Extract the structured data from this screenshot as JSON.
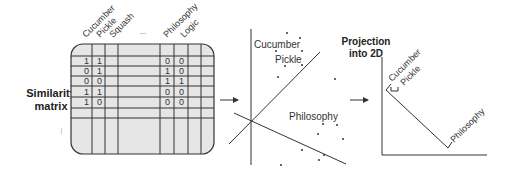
{
  "matrix_panel": {
    "label_line1": "Similarity",
    "label_line2": "matrix",
    "column_headers": [
      "Cucumber",
      "Pickle",
      "Squash",
      "...",
      "Philosophy",
      "Logic"
    ],
    "row_ellipsis": "...",
    "left_values": [
      [
        "1",
        "1"
      ],
      [
        "0",
        "1"
      ],
      [
        "0",
        "0"
      ],
      [
        "1",
        "1"
      ],
      [
        "1",
        "0"
      ]
    ],
    "right_values": [
      [
        "0",
        "0"
      ],
      [
        "1",
        "0"
      ],
      [
        "1",
        "1"
      ],
      [
        "0",
        "0"
      ],
      [
        "0",
        "0"
      ]
    ],
    "fill_color": "#e6e6e6"
  },
  "scatter_panel": {
    "labels": {
      "cucumber": "Cucumber",
      "pickle": "Pickle",
      "philosophy": "Philosophy"
    }
  },
  "projection_panel": {
    "title_line1": "Projection",
    "title_line2": "into 2D",
    "labels": {
      "cucumber": "Cucumber",
      "pickle": "Pickle",
      "philosophy": "Philosophy"
    }
  }
}
